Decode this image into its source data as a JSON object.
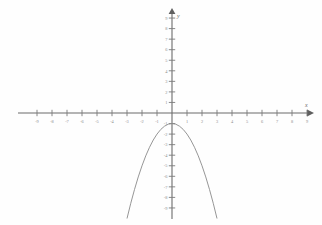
{
  "figure": {
    "type": "cartesian-graph",
    "background_color": "#fefefe",
    "axis_color": "#6b6b6b",
    "curve_color": "#8a8a8a",
    "label_color": "#8d8d8d"
  },
  "axes": {
    "x_axis_name": "x",
    "y_axis_name": "y",
    "x_tick_labels": [
      "-9",
      "-8",
      "-7",
      "-6",
      "-5",
      "-4",
      "-3",
      "-2",
      "-1",
      "1",
      "2",
      "3",
      "4",
      "5",
      "6",
      "7",
      "8",
      "9"
    ],
    "y_tick_labels": [
      "9",
      "8",
      "7",
      "6",
      "5",
      "4",
      "3",
      "2",
      "1",
      "-1",
      "-2",
      "-3",
      "-4",
      "-5",
      "-6",
      "-7",
      "-8",
      "-9"
    ]
  },
  "chart_data": {
    "type": "line",
    "title": "",
    "xlabel": "x",
    "ylabel": "y",
    "xlim": [
      -10,
      10
    ],
    "ylim": [
      -10,
      10
    ],
    "grid": false,
    "legend": "none",
    "x_ticks": [
      -9,
      -8,
      -7,
      -6,
      -5,
      -4,
      -3,
      -2,
      -1,
      0,
      1,
      2,
      3,
      4,
      5,
      6,
      7,
      8,
      9
    ],
    "y_ticks": [
      -9,
      -8,
      -7,
      -6,
      -5,
      -4,
      -3,
      -2,
      -1,
      0,
      1,
      2,
      3,
      4,
      5,
      6,
      7,
      8,
      9
    ],
    "series": [
      {
        "name": "parabola",
        "equation": "y = -x^2 - 1",
        "vertex": [
          0,
          -1
        ],
        "opens": "down",
        "x": [
          -3.0,
          -2.75,
          -2.5,
          -2.25,
          -2.0,
          -1.75,
          -1.5,
          -1.25,
          -1.0,
          -0.75,
          -0.5,
          -0.25,
          0.0,
          0.25,
          0.5,
          0.75,
          1.0,
          1.25,
          1.5,
          1.75,
          2.0,
          2.25,
          2.5,
          2.75,
          3.0
        ],
        "y": [
          -10.0,
          -8.56,
          -7.25,
          -6.06,
          -5.0,
          -4.06,
          -3.25,
          -2.56,
          -2.0,
          -1.56,
          -1.25,
          -1.06,
          -1.0,
          -1.06,
          -1.25,
          -1.56,
          -2.0,
          -2.56,
          -3.25,
          -4.06,
          -5.0,
          -6.06,
          -7.25,
          -8.56,
          -10.0
        ]
      }
    ]
  }
}
